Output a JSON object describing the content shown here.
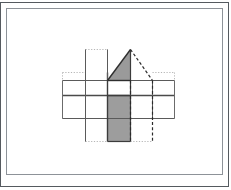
{
  "document": {
    "title": "Geometric net diagram",
    "background_color": "#ffffff"
  },
  "frame": {
    "outer_border_color": "#555a5f",
    "inner_border_color": "#8d9298",
    "outer": {
      "x": 0,
      "y": 2,
      "width": 229,
      "height": 185
    },
    "inner": {
      "x": 6,
      "y": 8,
      "width": 217,
      "height": 167
    }
  },
  "figure": {
    "name": "house-prism-net",
    "stroke_color": "#3c3c3c",
    "thin_stroke_color": "#6b6b6b",
    "dotted_color": "#b5b5b5",
    "dashed_color": "#2b2b2b",
    "roof_fill": "#9a9a9a",
    "face_fill": "#9d9d9d",
    "unfilled_fill": "#ffffff",
    "grid": {
      "x_lines": [
        62,
        85,
        107,
        130,
        152,
        174
      ],
      "y_lines": [
        49,
        72,
        95,
        118,
        141
      ],
      "cell_width": 22,
      "cell_height": 23
    },
    "shapes": [
      {
        "id": "roof-triangle",
        "type": "triangle",
        "fill": "#9a9a9a",
        "apex": [
          130,
          49
        ],
        "left": [
          107,
          80
        ],
        "right": [
          130,
          80
        ]
      },
      {
        "id": "roof-dashed-slope",
        "type": "dashed-line",
        "from": [
          130,
          49
        ],
        "to": [
          152,
          80
        ]
      },
      {
        "id": "shaded-face",
        "type": "rect",
        "fill": "#9d9d9d",
        "x": 107,
        "y": 95,
        "width": 23,
        "height": 46
      },
      {
        "id": "upper-center-cell",
        "type": "rect",
        "fill": "#ffffff",
        "x": 107,
        "y": 72,
        "width": 23,
        "height": 23
      },
      {
        "id": "top-dotted-box",
        "type": "dotted-rect",
        "x": 85,
        "y": 49,
        "width": 22,
        "height": 23
      },
      {
        "id": "bottom-dotted-box",
        "type": "dotted-rect",
        "x": 85,
        "y": 118,
        "width": 22,
        "height": 23
      },
      {
        "id": "left-dotted-edge",
        "type": "dotted-line",
        "from": [
          62,
          72
        ],
        "to": [
          62,
          118
        ]
      },
      {
        "id": "right-dotted-edge",
        "type": "dotted-line",
        "from": [
          174,
          72
        ],
        "to": [
          174,
          118
        ]
      },
      {
        "id": "dashed-vertical-a",
        "type": "dashed-line",
        "from": [
          130,
          80
        ],
        "to": [
          130,
          141
        ]
      },
      {
        "id": "dashed-vertical-b",
        "type": "dashed-line",
        "from": [
          152,
          80
        ],
        "to": [
          152,
          141
        ]
      }
    ]
  }
}
